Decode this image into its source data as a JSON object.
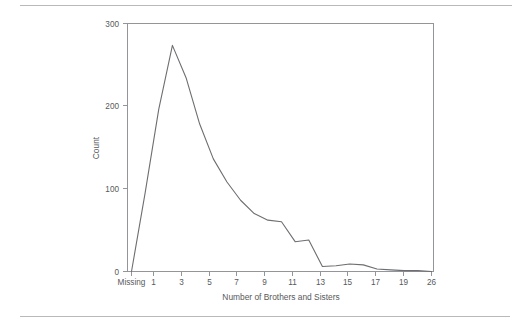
{
  "figure": {
    "top_rule": "",
    "bottom_rule": ""
  },
  "chart_data": {
    "type": "line",
    "title": "",
    "subtitle": "",
    "xlabel": "Number of Brothers and Sisters",
    "ylabel": "Count",
    "x_tick_labels": [
      "Missing",
      "1",
      "3",
      "5",
      "7",
      "9",
      "11",
      "13",
      "15",
      "17",
      "19",
      "26"
    ],
    "x_tick_values": [
      -1,
      1,
      3,
      5,
      7,
      9,
      11,
      13,
      15,
      17,
      19,
      21
    ],
    "y_tick_labels": [
      "0",
      "100",
      "200",
      "300"
    ],
    "y_tick_values": [
      0,
      100,
      200,
      300
    ],
    "xlim": [
      -1,
      21
    ],
    "ylim": [
      0,
      300
    ],
    "grid": false,
    "legend": null,
    "legend_position": "none",
    "series": [
      {
        "name": "Count",
        "color": "#6d6e71",
        "x": [
          -1,
          0,
          1,
          2,
          3,
          4,
          5,
          6,
          7,
          8,
          9,
          10,
          11,
          12,
          13,
          14,
          15,
          16,
          17,
          18,
          19,
          20,
          21
        ],
        "values": [
          0,
          95,
          196,
          273,
          234,
          178,
          136,
          108,
          86,
          70,
          62,
          60,
          36,
          38,
          6,
          7,
          9,
          8,
          3,
          2,
          1,
          1,
          0
        ]
      }
    ],
    "annotations": [
      "Peak count 273 occurs at 2 brothers and sisters",
      "Plateau near 60-62 around 9-10",
      "Secondary shoulder near 36-38 around 11-12",
      "Long low tail from 13 through 26",
      "Leftmost category is Missing with count 0"
    ]
  },
  "axis": {
    "y_label": "Count",
    "x_label": "Number of Brothers and Sisters"
  }
}
